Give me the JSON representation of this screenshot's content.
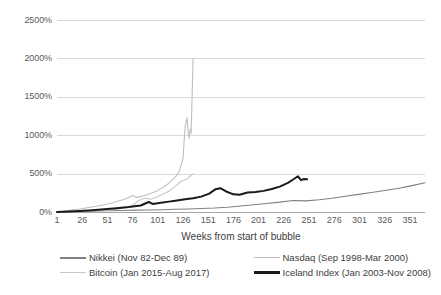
{
  "chart_data": {
    "type": "line",
    "title": "",
    "xlabel": "Weeks from start of bubble",
    "ylabel": "",
    "xlim": [
      1,
      366
    ],
    "ylim": [
      0,
      2500
    ],
    "grid": true,
    "legend_position": "bottom",
    "y_ticks": [
      "0%",
      "500%",
      "1000%",
      "1500%",
      "2000%",
      "2500%"
    ],
    "y_tick_values": [
      0,
      500,
      1000,
      1500,
      2000,
      2500
    ],
    "x_ticks": [
      "1",
      "26",
      "51",
      "76",
      "101",
      "126",
      "151",
      "176",
      "201",
      "226",
      "251",
      "276",
      "301",
      "326",
      "351"
    ],
    "x_tick_values": [
      1,
      26,
      51,
      76,
      101,
      126,
      151,
      176,
      201,
      226,
      251,
      276,
      301,
      326,
      351
    ],
    "series": [
      {
        "name": "Nikkei (Nov 82-Dec 89)",
        "color": "#808080",
        "width": 1.1,
        "x": [
          1,
          14,
          27,
          40,
          53,
          66,
          79,
          92,
          105,
          118,
          131,
          144,
          157,
          170,
          183,
          196,
          209,
          222,
          235,
          248,
          261,
          274,
          287,
          300,
          313,
          326,
          339,
          352,
          366
        ],
        "values": [
          0,
          4,
          9,
          14,
          16,
          20,
          24,
          26,
          30,
          35,
          40,
          46,
          52,
          62,
          78,
          95,
          110,
          128,
          150,
          145,
          160,
          180,
          205,
          230,
          255,
          280,
          305,
          340,
          380
        ]
      },
      {
        "name": "Nasdaq (Sep 1998-Mar 2000)",
        "color": "#bfbfbf",
        "width": 1.1,
        "x": [
          1,
          8,
          16,
          24,
          32,
          40,
          48,
          56,
          64,
          72,
          76,
          80,
          84,
          88,
          94,
          100,
          106,
          112,
          118,
          122,
          126,
          128,
          130,
          131,
          132,
          133,
          134,
          135,
          136
        ],
        "values": [
          0,
          10,
          25,
          40,
          58,
          75,
          95,
          120,
          150,
          185,
          215,
          190,
          200,
          215,
          240,
          275,
          320,
          375,
          450,
          520,
          700,
          1100,
          1230,
          1040,
          960,
          1080,
          1020,
          1500,
          2000
        ]
      },
      {
        "name": "Bitcoin (Jan 2015-Aug 2017)",
        "color": "#c8c8c8",
        "width": 1.1,
        "x": [
          1,
          10,
          20,
          30,
          40,
          50,
          60,
          70,
          76,
          82,
          88,
          94,
          100,
          106,
          112,
          118,
          124,
          130,
          136
        ],
        "values": [
          0,
          5,
          8,
          12,
          18,
          25,
          35,
          55,
          85,
          150,
          180,
          165,
          195,
          230,
          270,
          330,
          400,
          430,
          500
        ]
      },
      {
        "name": "Iceland Index (Jan 2003-Nov 2008)",
        "color": "#1a1a1a",
        "width": 2.0,
        "x": [
          1,
          12,
          24,
          36,
          48,
          60,
          72,
          84,
          92,
          96,
          104,
          112,
          120,
          128,
          136,
          144,
          152,
          158,
          163,
          170,
          176,
          182,
          190,
          198,
          206,
          214,
          222,
          230,
          236,
          240,
          243,
          246,
          249
        ],
        "values": [
          0,
          5,
          12,
          22,
          35,
          50,
          65,
          85,
          130,
          105,
          120,
          135,
          150,
          165,
          180,
          200,
          240,
          295,
          310,
          260,
          230,
          225,
          255,
          260,
          275,
          300,
          330,
          380,
          430,
          465,
          415,
          430,
          425
        ]
      }
    ]
  },
  "axis": {
    "x_title": "Weeks from start of bubble"
  },
  "legend": {
    "items": [
      {
        "label": "Nikkei (Nov 82-Dec 89)"
      },
      {
        "label": "Nasdaq (Sep 1998-Mar 2000)"
      },
      {
        "label": "Bitcoin (Jan 2015-Aug 2017)"
      },
      {
        "label": "Iceland Index (Jan 2003-Nov 2008)"
      }
    ]
  }
}
